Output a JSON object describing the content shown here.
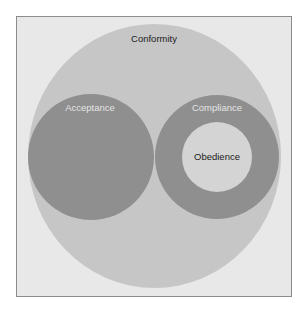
{
  "diagram": {
    "type": "nested-euler-diagram",
    "colors": {
      "background": "#e8e8e8",
      "frame_border": "#8c8c8c",
      "outer": "#c6c6c6",
      "dark": "#8f8f8f",
      "inner": "#d4d4d4",
      "dark_text": "#1c1c1c",
      "light_text": "#e4e4e4"
    },
    "sets": {
      "conformity": {
        "label": "Conformity"
      },
      "acceptance": {
        "label": "Acceptance"
      },
      "compliance": {
        "label": "Compliance"
      },
      "obedience": {
        "label": "Obedience"
      }
    },
    "relations": [
      "Acceptance ⊂ Conformity",
      "Compliance ⊂ Conformity",
      "Obedience ⊂ Compliance",
      "Acceptance ∩ Compliance = ∅"
    ]
  }
}
